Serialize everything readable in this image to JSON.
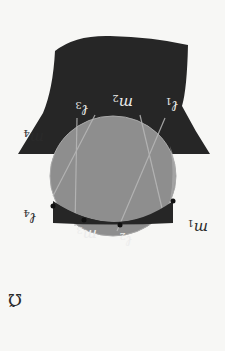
{
  "figure": {
    "orientation": "rotated-180",
    "region_label": "Ω̃",
    "colors": {
      "background": "#f7f7f5",
      "region": "#262626",
      "disc": "#8e8e8e",
      "disc_edge": "#a8a8a8",
      "chord": "#b4b4b4",
      "point": "#111111"
    },
    "labels": {
      "l1": {
        "base": "ℓ",
        "sub": "1"
      },
      "l2": {
        "base": "ℓ",
        "sub": "2"
      },
      "l3": {
        "base": "ℓ",
        "sub": "3"
      },
      "l4": {
        "base": "ℓ",
        "sub": "4"
      },
      "m1": {
        "base": "m",
        "sub": "1"
      },
      "m2": {
        "base": "m",
        "sub": "2"
      },
      "m3": {
        "base": "m",
        "sub": "3"
      },
      "m4": {
        "base": "m",
        "sub": "4"
      }
    },
    "points_count": 5
  }
}
